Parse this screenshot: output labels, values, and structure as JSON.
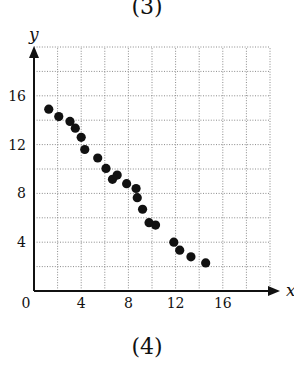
{
  "captions": {
    "top_cropped": "(3)",
    "bottom": "(4)"
  },
  "chart_data": {
    "type": "scatter",
    "title": "",
    "xlabel": "x",
    "ylabel": "y",
    "xlim": [
      0,
      20
    ],
    "ylim": [
      0,
      20
    ],
    "grid": true,
    "grid_step": 2,
    "xticks": [
      0,
      4,
      8,
      12,
      16
    ],
    "yticks": [
      4,
      8,
      12,
      16
    ],
    "origin_label": "0",
    "points": [
      {
        "x": 1.25,
        "y": 14.9
      },
      {
        "x": 2.1,
        "y": 14.3
      },
      {
        "x": 3.05,
        "y": 13.9
      },
      {
        "x": 3.5,
        "y": 13.35
      },
      {
        "x": 4.0,
        "y": 12.6
      },
      {
        "x": 4.3,
        "y": 11.6
      },
      {
        "x": 5.4,
        "y": 10.9
      },
      {
        "x": 6.1,
        "y": 10.05
      },
      {
        "x": 6.65,
        "y": 9.15
      },
      {
        "x": 7.05,
        "y": 9.5
      },
      {
        "x": 7.85,
        "y": 8.8
      },
      {
        "x": 8.65,
        "y": 8.4
      },
      {
        "x": 8.75,
        "y": 7.65
      },
      {
        "x": 9.2,
        "y": 6.7
      },
      {
        "x": 9.75,
        "y": 5.6
      },
      {
        "x": 10.3,
        "y": 5.4
      },
      {
        "x": 11.85,
        "y": 4.0
      },
      {
        "x": 12.35,
        "y": 3.35
      },
      {
        "x": 13.3,
        "y": 2.8
      },
      {
        "x": 14.55,
        "y": 2.3
      }
    ]
  }
}
